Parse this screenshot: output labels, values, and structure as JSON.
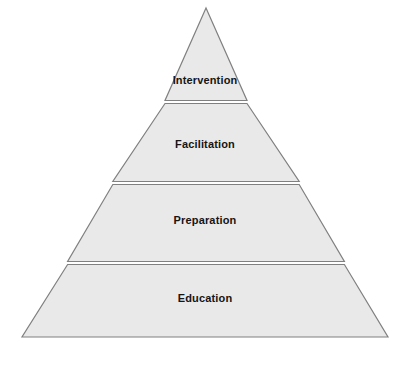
{
  "diagram": {
    "type": "pyramid",
    "orientation": "apex-up",
    "background_color": "#ffffff",
    "tier_fill_color": "#e9e9e9",
    "tier_stroke_color": "#808080",
    "divider_color": "#707070",
    "divider_gap_color": "#f7f7f7",
    "label_color": "#151515",
    "tier_count": 4,
    "geometry": {
      "apex_x": 206,
      "apex_y": 8,
      "base_left_x": 22,
      "base_right_x": 388,
      "base_y": 337,
      "divider_y": [
        101,
        182,
        262
      ]
    },
    "tiers": [
      {
        "label": "Intervention",
        "level": 1,
        "position": "top",
        "top_y": 8,
        "bottom_y": 101,
        "left_x": 165,
        "right_x": 247,
        "label_center_x": 206,
        "label_center_y": 81
      },
      {
        "label": "Facilitation",
        "level": 2,
        "position": "upper-middle",
        "top_y": 104,
        "bottom_y": 182,
        "left_x": 112,
        "right_x": 300,
        "label_center_x": 206,
        "label_center_y": 145
      },
      {
        "label": "Preparation",
        "level": 3,
        "position": "lower-middle",
        "top_y": 185,
        "bottom_y": 262,
        "left_x": 67,
        "right_x": 345,
        "label_center_x": 206,
        "label_center_y": 221
      },
      {
        "label": "Education",
        "level": 4,
        "position": "base",
        "top_y": 265,
        "bottom_y": 337,
        "left_x": 22,
        "right_x": 388,
        "label_center_x": 206,
        "label_center_y": 299
      }
    ]
  }
}
